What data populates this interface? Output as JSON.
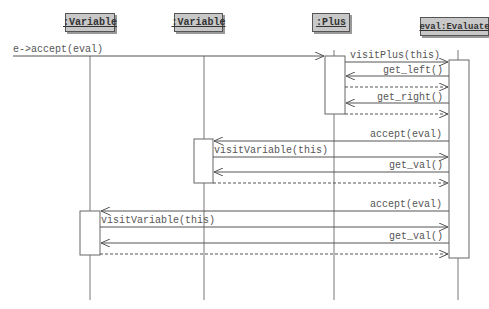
{
  "diagram": {
    "type": "uml-sequence",
    "lifelines": [
      {
        "id": "var1",
        "label": ":Variable",
        "x": 90
      },
      {
        "id": "var2",
        "label": ":Variable",
        "x": 204
      },
      {
        "id": "plus",
        "label": ":Plus",
        "x": 334
      },
      {
        "id": "eval",
        "label": "eval:Evaluate",
        "x": 458
      }
    ],
    "messages": [
      {
        "from": "external",
        "to": "plus",
        "label": "e->accept(eval)",
        "kind": "call"
      },
      {
        "from": "plus",
        "to": "eval",
        "label": "visitPlus(this)",
        "kind": "call"
      },
      {
        "from": "eval",
        "to": "plus",
        "label": "get_left()",
        "kind": "call"
      },
      {
        "from": "plus",
        "to": "eval",
        "label": "",
        "kind": "return"
      },
      {
        "from": "eval",
        "to": "plus",
        "label": "get_right()",
        "kind": "call"
      },
      {
        "from": "plus",
        "to": "eval",
        "label": "",
        "kind": "return"
      },
      {
        "from": "eval",
        "to": "var2",
        "label": "accept(eval)",
        "kind": "call"
      },
      {
        "from": "var2",
        "to": "eval",
        "label": "visitVariable(this)",
        "kind": "call"
      },
      {
        "from": "eval",
        "to": "var2",
        "label": "get_val()",
        "kind": "call"
      },
      {
        "from": "var2",
        "to": "eval",
        "label": "",
        "kind": "return"
      },
      {
        "from": "eval",
        "to": "var1",
        "label": "accept(eval)",
        "kind": "call"
      },
      {
        "from": "var1",
        "to": "eval",
        "label": "visitVariable(this)",
        "kind": "call"
      },
      {
        "from": "eval",
        "to": "var1",
        "label": "get_val()",
        "kind": "call"
      },
      {
        "from": "var1",
        "to": "eval",
        "label": "",
        "kind": "return"
      }
    ]
  },
  "labels": {
    "head_var1": ":Variable",
    "head_var2": ":Variable",
    "head_plus": ":Plus",
    "head_eval": "eval:Evaluate",
    "m1": "e->accept(eval)",
    "m2": "visitPlus(this)",
    "m3": "get_left()",
    "m5": "get_right()",
    "m7": "accept(eval)",
    "m8": "visitVariable(this)",
    "m9": "get_val()",
    "m11": "accept(eval)",
    "m12": "visitVariable(this)",
    "m13": "get_val()"
  }
}
